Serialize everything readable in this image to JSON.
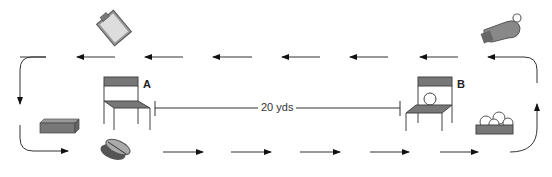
{
  "diagram": {
    "type": "drill-layout",
    "stations": [
      {
        "id": "A",
        "label": "A",
        "object": "chair"
      },
      {
        "id": "B",
        "label": "B",
        "object": "chair-with-ball"
      }
    ],
    "distance_label": "20 yds",
    "props": [
      {
        "name": "clipboard",
        "position": "top-left"
      },
      {
        "name": "whistle",
        "position": "top-right"
      },
      {
        "name": "block-cone",
        "position": "left"
      },
      {
        "name": "shoes",
        "position": "bottom-left"
      },
      {
        "name": "ball-basket",
        "position": "right"
      }
    ],
    "flow": {
      "top_row_direction": "right-to-left",
      "bottom_row_direction": "left-to-right",
      "top_arrows": 7,
      "bottom_arrows": 6
    },
    "colors": {
      "line": "#333333",
      "seat": "#666666",
      "object": "#888888"
    }
  }
}
